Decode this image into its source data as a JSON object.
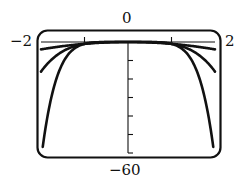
{
  "labels": {
    "top": "0",
    "bottom": "−60",
    "left": "−2",
    "right": "2"
  },
  "colors": {
    "curve": "#111111",
    "frame": "#111111",
    "background": "#ffffff"
  },
  "chart_data": {
    "type": "line",
    "title": "",
    "xlabel": "",
    "ylabel": "",
    "xlim": [
      -2,
      2
    ],
    "ylim": [
      -60,
      0
    ],
    "x_ticks": [
      -1,
      0,
      1
    ],
    "y_ticks": [
      0,
      -10,
      -20,
      -30,
      -40,
      -50,
      -60
    ],
    "grid": false,
    "legend": "none",
    "window_labels": {
      "xmin": "-2",
      "xmax": "2",
      "ymin": "-60",
      "ymax": "0"
    },
    "series": [
      {
        "name": "y = -x^2",
        "x": [
          -2,
          -1.5,
          -1,
          -0.5,
          0,
          0.5,
          1,
          1.5,
          2
        ],
        "values": [
          -4,
          -2.25,
          -1,
          -0.25,
          0,
          -0.25,
          -1,
          -2.25,
          -4
        ]
      },
      {
        "name": "y = -x^4",
        "x": [
          -2,
          -1.5,
          -1,
          -0.5,
          0,
          0.5,
          1,
          1.5,
          2
        ],
        "values": [
          -16,
          -5.06,
          -1,
          -0.06,
          0,
          -0.06,
          -1,
          -5.06,
          -16
        ]
      },
      {
        "name": "y = -x^6",
        "x": [
          -1.98,
          -1.5,
          -1,
          -0.5,
          0,
          0.5,
          1,
          1.5,
          1.98
        ],
        "values": [
          -60,
          -11.39,
          -1,
          -0.02,
          0,
          -0.02,
          -1,
          -11.39,
          -60
        ]
      }
    ]
  }
}
